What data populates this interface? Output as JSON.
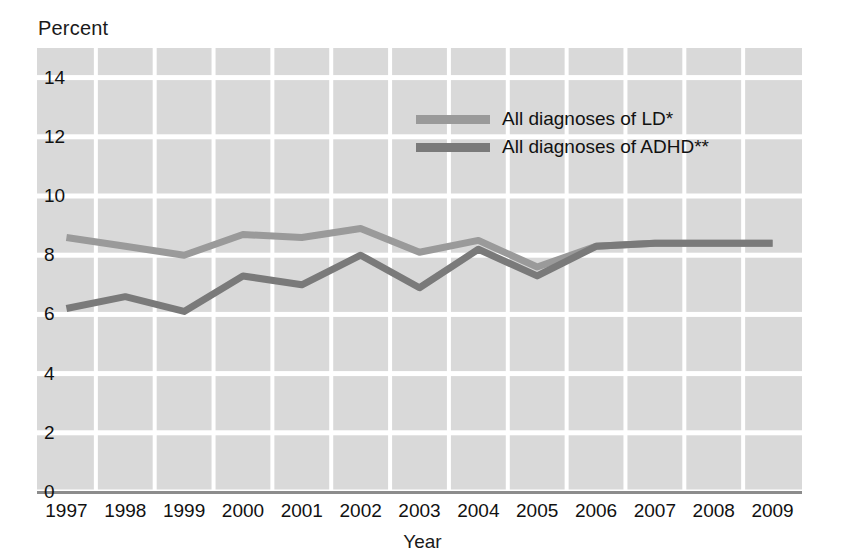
{
  "chart_data": {
    "type": "line",
    "title": "",
    "xlabel": "Year",
    "ylabel": "Percent",
    "categories": [
      "1997",
      "1998",
      "1999",
      "2000",
      "2001",
      "2002",
      "2003",
      "2004",
      "2005",
      "2006",
      "2007",
      "2008",
      "2009"
    ],
    "x": [
      1997,
      1998,
      1999,
      2000,
      2001,
      2002,
      2003,
      2004,
      2005,
      2006,
      2007,
      2008,
      2009
    ],
    "xlim": [
      1997,
      2009
    ],
    "ylim": [
      0,
      15
    ],
    "yticks": [
      0,
      2,
      4,
      6,
      8,
      10,
      12,
      14
    ],
    "grid": true,
    "legend_position": "upper-center-right",
    "series": [
      {
        "name": "All diagnoses of LD*",
        "color": "#9a9a9a",
        "values": [
          8.6,
          8.3,
          8.0,
          8.7,
          8.6,
          8.9,
          8.1,
          8.5,
          7.6,
          8.3,
          8.4,
          8.4,
          8.4
        ]
      },
      {
        "name": "All diagnoses of ADHD**",
        "color": "#7a7a7a",
        "values": [
          6.2,
          6.6,
          6.1,
          7.3,
          7.0,
          8.0,
          6.9,
          8.2,
          7.3,
          8.3,
          8.4,
          8.4,
          8.4
        ]
      }
    ]
  },
  "axes": {
    "ylabel_title": "Percent",
    "xlabel_title": "Year",
    "yticks": [
      "14",
      "12",
      "10",
      "8",
      "6",
      "4",
      "2",
      "0"
    ],
    "xticks": [
      "1997",
      "1998",
      "1999",
      "2000",
      "2001",
      "2002",
      "2003",
      "2004",
      "2005",
      "2006",
      "2007",
      "2008",
      "2009"
    ]
  },
  "legend": {
    "items": [
      {
        "label": "All diagnoses of LD*",
        "color": "#9a9a9a"
      },
      {
        "label": "All diagnoses of ADHD**",
        "color": "#7a7a7a"
      }
    ]
  },
  "colors": {
    "plot_background": "#d9d9d9",
    "gridline": "#ffffff",
    "axis": "#8c8c8c",
    "series_ld": "#9a9a9a",
    "series_adhd": "#7a7a7a",
    "text": "#111111"
  }
}
